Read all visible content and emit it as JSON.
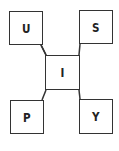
{
  "diagram": {
    "center": {
      "label": "I"
    },
    "nodes": [
      {
        "id": "top-left",
        "label": "U"
      },
      {
        "id": "top-right",
        "label": "S"
      },
      {
        "id": "bottom-left",
        "label": "P"
      },
      {
        "id": "bottom-right",
        "label": "Y"
      }
    ],
    "colors": {
      "stroke": "#333333",
      "text": "#222222",
      "background": "#ffffff"
    }
  }
}
